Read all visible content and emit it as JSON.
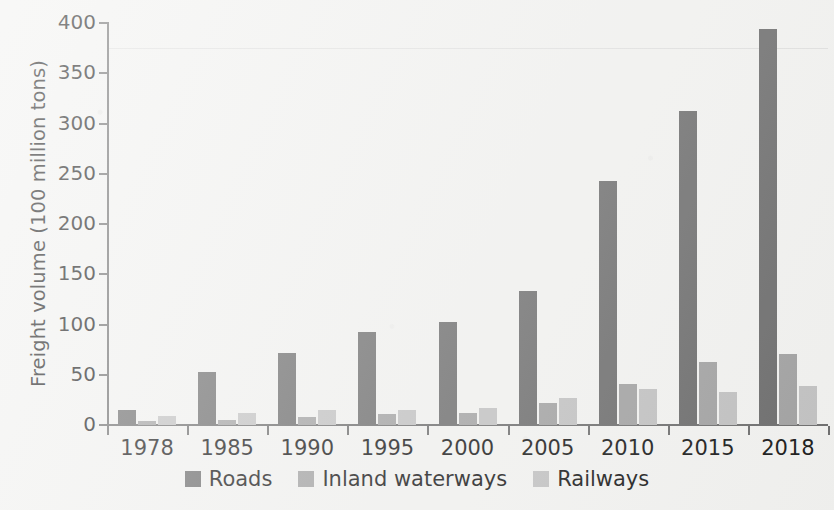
{
  "chart_data": {
    "type": "bar",
    "title": "",
    "xlabel": "",
    "ylabel": "Freight volume (100 million tons)",
    "ylim": [
      0,
      400
    ],
    "ytick_step": 50,
    "yticks": [
      "400",
      "350",
      "300",
      "250",
      "200",
      "150",
      "100",
      "50",
      "0"
    ],
    "grid": false,
    "legend_position": "bottom",
    "categories": [
      "1978",
      "1985",
      "1990",
      "1995",
      "2000",
      "2005",
      "2010",
      "2015",
      "2018"
    ],
    "series": [
      {
        "name": "Roads",
        "color": "#6e6e6e",
        "values": [
          15,
          53,
          72,
          93,
          103,
          133,
          243,
          312,
          394
        ]
      },
      {
        "name": "Inland waterways",
        "color": "#a3a3a3",
        "values": [
          4,
          5,
          8,
          11,
          12,
          22,
          41,
          63,
          71
        ]
      },
      {
        "name": "Railways",
        "color": "#c2c2c2",
        "values": [
          9,
          12,
          15,
          15,
          17,
          27,
          36,
          33,
          39
        ]
      }
    ]
  },
  "legend": {
    "items": [
      {
        "label": "Roads",
        "color": "#6e6e6e"
      },
      {
        "label": "Inland waterways",
        "color": "#a3a3a3"
      },
      {
        "label": "Railways",
        "color": "#c2c2c2"
      }
    ]
  },
  "colors": {
    "background": "#f2f2f0",
    "axis": "#6f6f6f",
    "text": "#1b1b1b"
  }
}
